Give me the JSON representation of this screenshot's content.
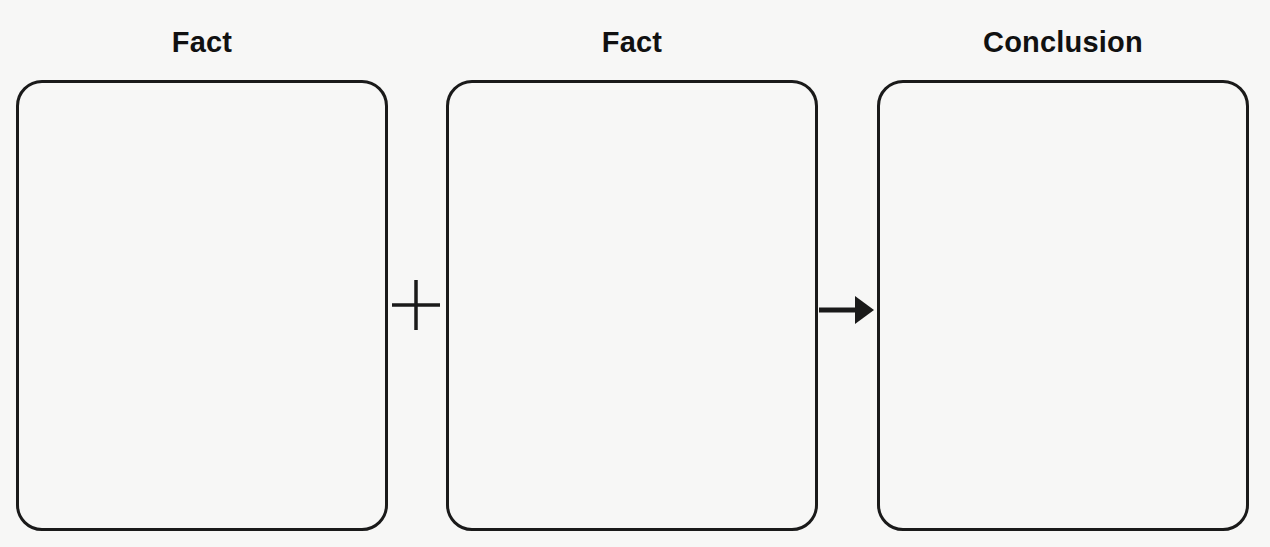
{
  "diagram": {
    "columns": [
      {
        "title": "Fact",
        "content": ""
      },
      {
        "title": "Fact",
        "content": ""
      },
      {
        "title": "Conclusion",
        "content": ""
      }
    ],
    "connectors": [
      {
        "type": "plus",
        "symbol": "+"
      },
      {
        "type": "arrow",
        "symbol": "→"
      }
    ],
    "colors": {
      "background": "#f7f7f6",
      "stroke": "#1a1a1a"
    }
  }
}
